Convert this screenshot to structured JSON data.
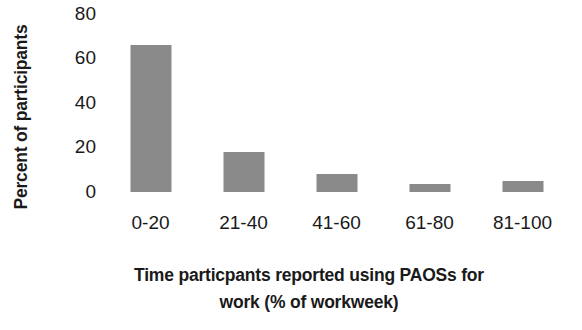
{
  "chart_data": {
    "type": "bar",
    "title": "",
    "subtitle": "",
    "xlabel_lines": [
      "Time particpants reported using PAOSs for",
      "work (% of workweek)"
    ],
    "xlabel": "Time particpants reported using PAOSs for work (% of workweek)",
    "ylabel": "Percent of participants",
    "categories": [
      "0-20",
      "21-40",
      "41-60",
      "61-80",
      "81-100"
    ],
    "values": [
      66,
      18,
      8,
      3.5,
      5
    ],
    "ylim": [
      0,
      80
    ],
    "yticks": [
      80,
      60,
      40,
      20,
      0
    ],
    "ytick_labels": [
      "80",
      "60",
      "40",
      "20",
      "0"
    ],
    "grid": false,
    "axis_lines": false,
    "legend": null,
    "legend_position": "none",
    "bar_color": "#8a8a8a",
    "background_color": "#ffffff",
    "text_color": "#1a1a1a",
    "orientation": "vertical"
  }
}
